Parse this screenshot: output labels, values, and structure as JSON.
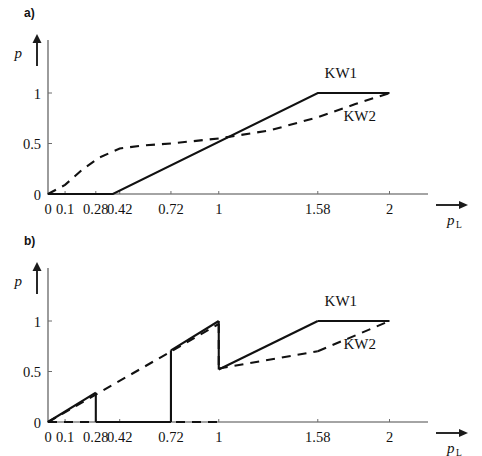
{
  "figure": {
    "background": "#ffffff",
    "ink_color": "#111111",
    "axis_color": "#4a4a4a"
  },
  "panels": [
    {
      "id": "a",
      "label": "a)",
      "chart_data": {
        "type": "line",
        "title": "",
        "xlabel": "p",
        "xlabel_sub": "L",
        "ylabel": "p",
        "xlim": [
          0,
          2.12
        ],
        "ylim": [
          0,
          1.22
        ],
        "xticks": [
          0,
          0.1,
          0.28,
          0.42,
          0.72,
          1,
          1.58,
          2
        ],
        "xticklabels": [
          "0",
          "0.1",
          "0.28",
          "0.42",
          "0.72",
          "1",
          "1.58",
          "2"
        ],
        "yticks": [
          0,
          0.5,
          1
        ],
        "yticklabels": [
          "0",
          "0.5",
          "1"
        ],
        "grid": false,
        "legend_position": "inline-right",
        "series": [
          {
            "name": "KW1",
            "style": "solid",
            "label_x": 1.62,
            "label_y": 1.15,
            "points": [
              [
                0,
                0
              ],
              [
                0.38,
                0
              ],
              [
                1.58,
                1
              ],
              [
                2,
                1
              ]
            ]
          },
          {
            "name": "KW2",
            "style": "dashed",
            "label_x": 1.73,
            "label_y": 0.72,
            "points": [
              [
                0,
                0
              ],
              [
                0.1,
                0.09
              ],
              [
                0.2,
                0.24
              ],
              [
                0.3,
                0.36
              ],
              [
                0.42,
                0.45
              ],
              [
                0.55,
                0.48
              ],
              [
                0.72,
                0.5
              ],
              [
                1.0,
                0.55
              ],
              [
                1.3,
                0.63
              ],
              [
                1.58,
                0.76
              ],
              [
                1.8,
                0.89
              ],
              [
                2,
                1
              ]
            ]
          }
        ]
      }
    },
    {
      "id": "b",
      "label": "b)",
      "chart_data": {
        "type": "line",
        "title": "",
        "xlabel": "p",
        "xlabel_sub": "L",
        "ylabel": "p",
        "xlim": [
          0,
          2.12
        ],
        "ylim": [
          0,
          1.22
        ],
        "xticks": [
          0,
          0.1,
          0.28,
          0.42,
          0.72,
          1,
          1.58,
          2
        ],
        "xticklabels": [
          "0",
          "0.1",
          "0.28",
          "0.42",
          "0.72",
          "1",
          "1.58",
          "2"
        ],
        "yticks": [
          0,
          0.5,
          1
        ],
        "yticklabels": [
          "0",
          "0.5",
          "1"
        ],
        "grid": false,
        "legend_position": "inline-right",
        "series": [
          {
            "name": "KW1",
            "style": "solid",
            "label_x": 1.62,
            "label_y": 1.15,
            "segments": [
              [
                [
                  0,
                  0
                ],
                [
                  0.28,
                  0.29
                ]
              ],
              [
                [
                  0.28,
                  0.29
                ],
                [
                  0.28,
                  0
                ]
              ],
              [
                [
                  0.28,
                  0
                ],
                [
                  0.72,
                  0
                ]
              ],
              [
                [
                  0.72,
                  0
                ],
                [
                  0.72,
                  0.71
                ]
              ],
              [
                [
                  0.72,
                  0.71
                ],
                [
                  1.0,
                  1.0
                ]
              ],
              [
                [
                  1.0,
                  1.0
                ],
                [
                  1.0,
                  0.52
                ]
              ],
              [
                [
                  1.0,
                  0.52
                ],
                [
                  1.58,
                  1.0
                ]
              ],
              [
                [
                  1.58,
                  1.0
                ],
                [
                  2.0,
                  1.0
                ]
              ]
            ]
          },
          {
            "name": "KW2",
            "style": "dashed",
            "label_x": 1.73,
            "label_y": 0.72,
            "segments": [
              [
                [
                  0,
                  0
                ],
                [
                  1.0,
                  0.0
                ]
              ],
              [
                [
                  0,
                  0
                ],
                [
                  1.0,
                  0.97
                ]
              ],
              [
                [
                  1.0,
                  0.97
                ],
                [
                  1.0,
                  0.53
                ]
              ],
              [
                [
                  1.0,
                  0.53
                ],
                [
                  1.58,
                  0.7
                ]
              ],
              [
                [
                  1.58,
                  0.7
                ],
                [
                  2.0,
                  1.0
                ]
              ]
            ]
          }
        ]
      }
    }
  ]
}
